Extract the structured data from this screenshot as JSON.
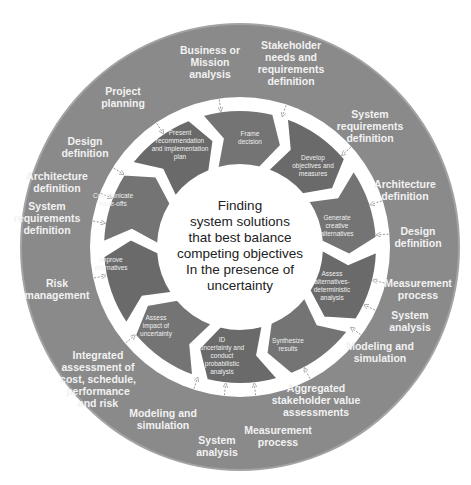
{
  "center": {
    "text": "Finding\nsystem solutions\nthat best balance\ncompeting objectives\nIn the presence of\nuncertainty"
  },
  "colors": {
    "outer_ring": "#8a8a8a",
    "outer_ring_edge": "#a3a3a3",
    "band": "#ffffff",
    "arrow": "#6f6f6f",
    "arrow_dark": "#5c5c5c",
    "label_text": "#f2f2f2",
    "center_text": "#222222"
  },
  "outer_ring": {
    "items": [
      {
        "label": "Business or\nMission\nanalysis",
        "x": 210,
        "y": 62
      },
      {
        "label": "Stakeholder\nneeds and\nrequirements\ndefinition",
        "x": 291,
        "y": 63
      },
      {
        "label": "System\nrequirements\ndefinition",
        "x": 370,
        "y": 126
      },
      {
        "label": "Architecture\ndefinition",
        "x": 405,
        "y": 190
      },
      {
        "label": "Design\ndefinition",
        "x": 418,
        "y": 237
      },
      {
        "label": "Measurement\nprocess",
        "x": 418,
        "y": 289
      },
      {
        "label": "System\nanalysis",
        "x": 410,
        "y": 321
      },
      {
        "label": "Modeling and\nsimulation",
        "x": 380,
        "y": 352
      },
      {
        "label": "Aggregated\nstakeholder value\nassessments",
        "x": 316,
        "y": 400
      },
      {
        "label": "Measurement\nprocess",
        "x": 278,
        "y": 436
      },
      {
        "label": "System\nanalysis",
        "x": 217,
        "y": 446
      },
      {
        "label": "Modeling and\nsimulation",
        "x": 163,
        "y": 419
      },
      {
        "label": "Integrated\nassessment of\ncost, schedule,\nperformance\nand risk",
        "x": 98,
        "y": 379
      },
      {
        "label": "Risk\nmanagement",
        "x": 57,
        "y": 289
      },
      {
        "label": "System\nrequirements\ndefinition",
        "x": 47,
        "y": 218
      },
      {
        "label": "Architecture\ndefinition",
        "x": 57,
        "y": 182
      },
      {
        "label": "Design\ndefinition",
        "x": 85,
        "y": 147
      },
      {
        "label": "Project\nplanning",
        "x": 123,
        "y": 97
      }
    ]
  },
  "inner_ring": {
    "steps": [
      {
        "label": "Frame\ndecision",
        "x": 250,
        "y": 138
      },
      {
        "label": "Develop\nobjectives and\nmeasures",
        "x": 313,
        "y": 166
      },
      {
        "label": "Generate\ncreative\nalternatives",
        "x": 337,
        "y": 226
      },
      {
        "label": "Assess\nalternatives-\ndeterministic\nanalysis",
        "x": 332,
        "y": 286
      },
      {
        "label": "Synthesize\nresults",
        "x": 288,
        "y": 345
      },
      {
        "label": "ID\nuncertainty and\nconduct\nprobabilistic\nanalysis",
        "x": 222,
        "y": 356
      },
      {
        "label": "Assess\nimpact of\nuncertainty",
        "x": 156,
        "y": 326
      },
      {
        "label": "Improve\nalternatives",
        "x": 111,
        "y": 264
      },
      {
        "label": "Communicate\ntrade-offs",
        "x": 113,
        "y": 200
      },
      {
        "label": "Present\nrecommendation\nand implementation\nplan",
        "x": 180,
        "y": 145
      }
    ]
  }
}
